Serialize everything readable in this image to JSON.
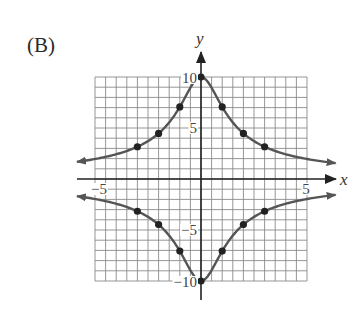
{
  "figure_label": "(B)",
  "chart_data": {
    "type": "line",
    "title": "",
    "xlabel": "x",
    "ylabel": "y",
    "xlim": [
      -5,
      5
    ],
    "ylim": [
      -10,
      10
    ],
    "grid": true,
    "x_grid_step": 0.5,
    "y_grid_step": 1,
    "x_tick_labels": [
      {
        "value": -5,
        "label": "−5"
      },
      {
        "value": 5,
        "label": "5"
      }
    ],
    "y_tick_labels": [
      {
        "value": 10,
        "label": "10"
      },
      {
        "value": 5,
        "label": "5"
      },
      {
        "value": -5,
        "label": "−5"
      },
      {
        "value": -10,
        "label": "−10"
      }
    ],
    "series": [
      {
        "name": "upper branch",
        "function": "y = 10/sqrt(1+x^2)",
        "points": [
          {
            "x": -3,
            "y": 3.16
          },
          {
            "x": -2,
            "y": 4.47
          },
          {
            "x": -1,
            "y": 7.07
          },
          {
            "x": 0,
            "y": 10
          },
          {
            "x": 1,
            "y": 7.07
          },
          {
            "x": 2,
            "y": 4.47
          },
          {
            "x": 3,
            "y": 3.16
          }
        ],
        "arrows_both_ends": true
      },
      {
        "name": "lower branch",
        "function": "y = -10/sqrt(1+x^2)",
        "points": [
          {
            "x": -3,
            "y": -3.16
          },
          {
            "x": -2,
            "y": -4.47
          },
          {
            "x": -1,
            "y": -7.07
          },
          {
            "x": 0,
            "y": -10
          },
          {
            "x": 1,
            "y": -7.07
          },
          {
            "x": 2,
            "y": -4.47
          },
          {
            "x": 3,
            "y": -3.16
          }
        ],
        "arrows_both_ends": true
      }
    ],
    "colors": {
      "curve": "#555555",
      "point": "#222222",
      "grid": "#8a8a8a",
      "axis": "#222222"
    }
  }
}
